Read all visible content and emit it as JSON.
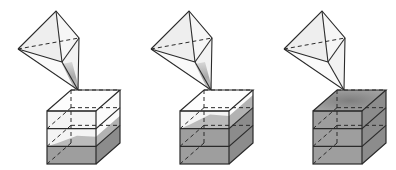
{
  "diagram": {
    "colors": {
      "background": "#ffffff",
      "line": "#2a2a2a",
      "pyramid_face": "#eeeeee",
      "pyramid_face_light": "#f6f6f6",
      "fill": "#9e9e9e",
      "fill_side": "#8c8c8c",
      "fill_top": "#a8a8a8",
      "empty_face": "#f4f4f4",
      "stream": "#b5b5b5"
    },
    "stages": [
      {
        "id": 1,
        "layers_filled": 1,
        "stream": true,
        "partial_layer_fill": 0.6
      },
      {
        "id": 2,
        "layers_filled": 2,
        "stream": true,
        "partial_layer_fill": 0.8
      },
      {
        "id": 3,
        "layers_filled": 3,
        "stream": false,
        "partial_layer_fill": 0
      }
    ]
  }
}
